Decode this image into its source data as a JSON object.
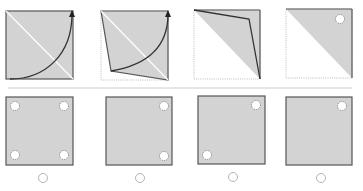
{
  "puzzle": {
    "question_panels": [
      {
        "id": "step-1",
        "description": "square with diagonal crease and fold arrow"
      },
      {
        "id": "step-2",
        "description": "corner folded toward center"
      },
      {
        "id": "step-3",
        "description": "folded into triangle"
      },
      {
        "id": "step-4",
        "description": "triangle with punched hole"
      }
    ],
    "options": [
      {
        "id": "option-1",
        "holes": [
          "top-left",
          "top-right",
          "bottom-left",
          "bottom-right"
        ]
      },
      {
        "id": "option-2",
        "holes": [
          "top-right",
          "bottom-right"
        ]
      },
      {
        "id": "option-3",
        "holes": [
          "top-right",
          "bottom-left"
        ]
      },
      {
        "id": "option-4",
        "holes": [
          "top-right"
        ]
      }
    ]
  },
  "colors": {
    "paper_fill": "#d3d3d3",
    "border": "#555555",
    "fold_line": "#333333",
    "crease": "#ffffff",
    "separator": "#cccccc",
    "dotted_outline": "#bbbbbb",
    "radio_border": "#b5b5b5"
  }
}
